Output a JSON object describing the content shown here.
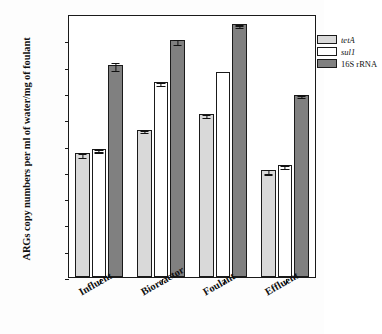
{
  "chart_data": {
    "type": "bar",
    "title": "",
    "xlabel": "",
    "ylabel": "ARGs copy numbers per ml of water/mg of foulant",
    "categories": [
      "Influent",
      "Bioreactor",
      "Foulant",
      "Effluent"
    ],
    "series": [
      {
        "name": "tetA",
        "italic": true,
        "color": "#d9d9d9",
        "values": [
          5000.0,
          40000.0,
          155000.0,
          1200.0
        ],
        "errors": [
          1000.0,
          5000.0,
          20000.0,
          250.0
        ]
      },
      {
        "name": "sul1",
        "italic": true,
        "color": "#ffffff",
        "values": [
          7500.0,
          2500000.0,
          6500000.0,
          1800.0
        ],
        "errors": [
          1000.0,
          300000.0,
          0,
          300.0
        ]
      },
      {
        "name": "16S rRNA",
        "italic": false,
        "color": "#808080",
        "values": [
          12000000.0,
          100000000.0,
          400000000.0,
          850000.0
        ],
        "errors": [
          4000000.0,
          20000000.0,
          40000000.0,
          100000.0
        ]
      }
    ],
    "ylim": [
      0.1,
      1000000000
    ],
    "ytick_labels": [
      "1E+08",
      "1E+07",
      "1E+06",
      "1E+05",
      "1E+04",
      "1E+03",
      "1E+02",
      "1E+01",
      "1E+00",
      "1E-01"
    ],
    "ytick_values": [
      100000000,
      10000000,
      1000000,
      100000,
      10000,
      1000,
      100,
      10,
      1,
      0.1
    ],
    "log_scale": true,
    "grid": false,
    "legend_position": "top-right",
    "frame_color": "#1a1a1a"
  }
}
